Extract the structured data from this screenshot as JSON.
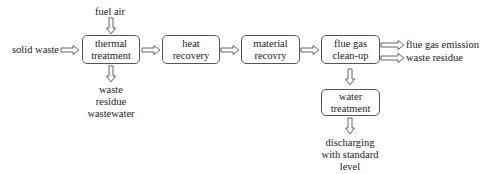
{
  "diagram": {
    "inputs": {
      "solid_waste": "solid waste",
      "fuel_air": "fuel air"
    },
    "boxes": {
      "thermal": {
        "line1": "thermal",
        "line2": "treatment"
      },
      "heat": {
        "line1": "heat",
        "line2": "recovery"
      },
      "material": {
        "line1": "material",
        "line2": "recovry"
      },
      "flue": {
        "line1": "flue gas",
        "line2": "clean-up"
      },
      "water": {
        "line1": "water",
        "line2": "treatment"
      }
    },
    "outputs": {
      "thermal_out": {
        "line1": "waste",
        "line2": "residue",
        "line3": "wastewater"
      },
      "flue_gas_emission": "flue gas emission",
      "waste_residue": "waste residue",
      "discharge": {
        "line1": "discharging",
        "line2": "with standard",
        "line3": "level"
      }
    },
    "colors": {
      "stroke": "#555555",
      "text": "#222222",
      "background": "#ffffff"
    }
  }
}
